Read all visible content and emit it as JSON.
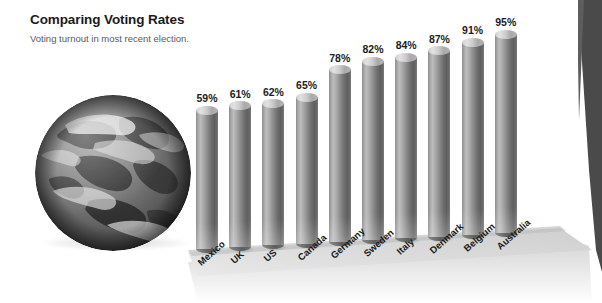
{
  "header": {
    "title": "Comparing Voting Rates",
    "subtitle": "Voting turnout in most recent election."
  },
  "graphic": {
    "globe_alt": "earth-globe",
    "background_color": "#ffffff",
    "floor_color": "#d8d8d8",
    "backwall_color": "#4a4a4a",
    "bar_color": "#7f7f7f",
    "bar_highlight_color": "#bdbdbd",
    "bar_shadow_color": "#5c5c5c",
    "title_color": "#1a1a1a",
    "subtitle_color": "#5a5a5a"
  },
  "chart_data": {
    "type": "bar",
    "title": "Comparing Voting Rates",
    "subtitle": "Voting turnout in most recent election.",
    "xlabel": "",
    "ylabel": "",
    "unit": "%",
    "ylim": [
      0,
      100
    ],
    "grid": false,
    "legend": false,
    "categories": [
      "Mexico",
      "UK",
      "US",
      "Canada",
      "Germany",
      "Sweden",
      "Italy",
      "Denmark",
      "Belgium",
      "Australia"
    ],
    "values": [
      59,
      61,
      62,
      65,
      78,
      82,
      84,
      87,
      91,
      95
    ],
    "data_labels": [
      "59%",
      "61%",
      "62%",
      "65%",
      "78%",
      "82%",
      "84%",
      "87%",
      "91%",
      "95%"
    ]
  }
}
